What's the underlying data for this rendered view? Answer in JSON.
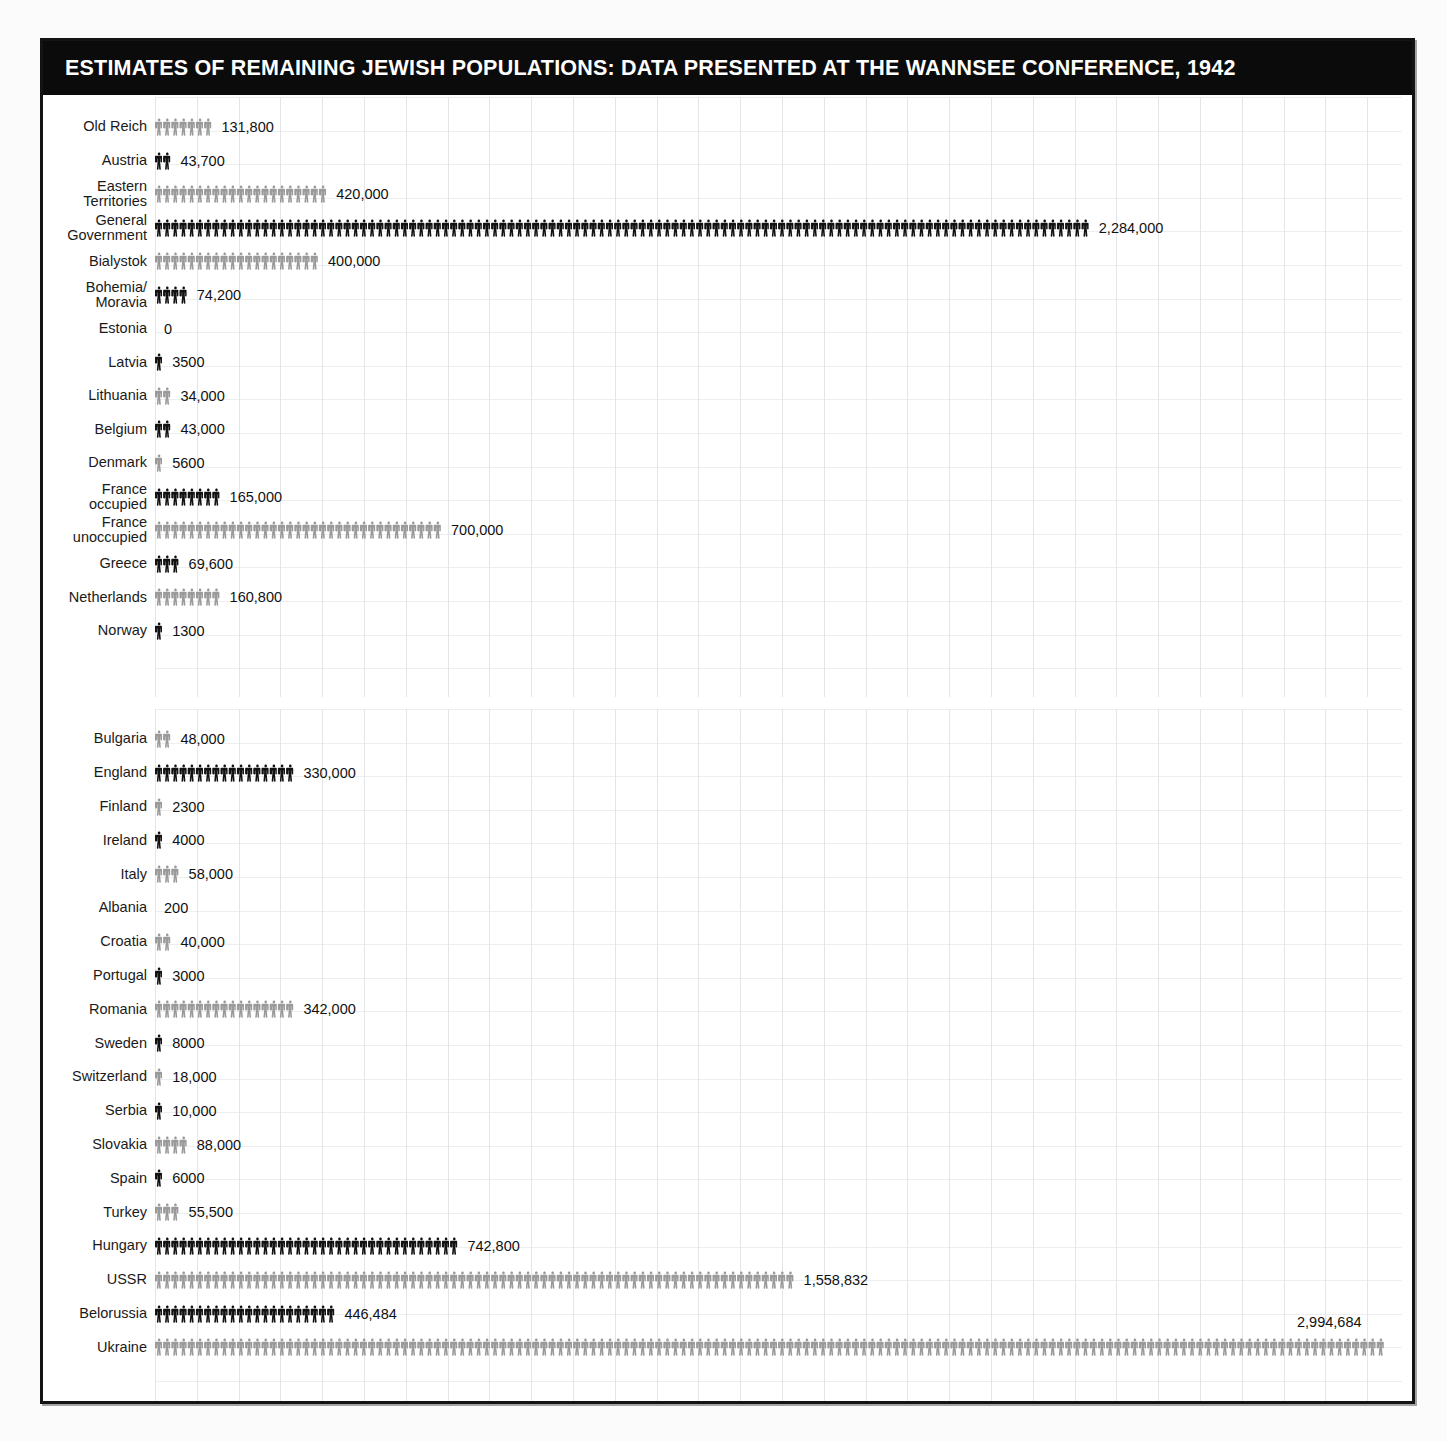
{
  "title": "ESTIMATES OF REMAINING JEWISH POPULATIONS: DATA PRESENTED AT THE WANNSEE CONFERENCE, 1942",
  "colors": {
    "dark_figure": "#121212",
    "light_figure": "#9a9a9a",
    "title_bar": "#0b0b0b",
    "title_text": "#ffffff",
    "grid_line": "#e3e6e8",
    "frame": "#131313",
    "label_text": "#1a1a1a",
    "value_text": "#111111"
  },
  "chart_data": {
    "type": "bar",
    "title": "ESTIMATES OF REMAINING JEWISH POPULATIONS: DATA PRESENTED AT THE WANNSEE CONFERENCE, 1942",
    "xlabel": "",
    "ylabel": "",
    "units_per_icon": 20000,
    "px_per_person": 0.00041,
    "grid": true,
    "legend": "none",
    "xlim": [
      0,
      3050000
    ],
    "panels": [
      {
        "name": "panel-occupied-and-axis-europe",
        "categories": [
          "Old Reich",
          "Austria",
          "Eastern Territories",
          "General Government",
          "Bialystok",
          "Bohemia/ Moravia",
          "Estonia",
          "Latvia",
          "Lithuania",
          "Belgium",
          "Denmark",
          "France occupied",
          "France unoccupied",
          "Greece",
          "Netherlands",
          "Norway"
        ],
        "values": [
          131800,
          43700,
          420000,
          2284000,
          400000,
          74200,
          0,
          3500,
          34000,
          43000,
          5600,
          165000,
          700000,
          69600,
          160800,
          1300
        ],
        "labels": [
          "131,800",
          "43,700",
          "420,000",
          "2,284,000",
          "400,000",
          "74,200",
          "0",
          "3500",
          "34,000",
          "43,000",
          "5600",
          "165,000",
          "700,000",
          "69,600",
          "160,800",
          "1300"
        ],
        "shades": [
          "light",
          "dark",
          "light",
          "dark",
          "light",
          "dark",
          "light",
          "dark",
          "light",
          "dark",
          "light",
          "dark",
          "light",
          "dark",
          "light",
          "dark"
        ],
        "rows": [
          {
            "label": "Old Reich",
            "label_lines": [
              "Old Reich"
            ],
            "value": 131800,
            "display": "131,800",
            "shade": "light"
          },
          {
            "label": "Austria",
            "label_lines": [
              "Austria"
            ],
            "value": 43700,
            "display": "43,700",
            "shade": "dark"
          },
          {
            "label": "Eastern Territories",
            "label_lines": [
              "Eastern",
              "Territories"
            ],
            "value": 420000,
            "display": "420,000",
            "shade": "light"
          },
          {
            "label": "General Government",
            "label_lines": [
              "General",
              "Government"
            ],
            "value": 2284000,
            "display": "2,284,000",
            "shade": "dark"
          },
          {
            "label": "Bialystok",
            "label_lines": [
              "Bialystok"
            ],
            "value": 400000,
            "display": "400,000",
            "shade": "light"
          },
          {
            "label": "Bohemia/ Moravia",
            "label_lines": [
              "Bohemia/",
              "Moravia"
            ],
            "value": 74200,
            "display": "74,200",
            "shade": "dark"
          },
          {
            "label": "Estonia",
            "label_lines": [
              "Estonia"
            ],
            "value": 0,
            "display": "0",
            "shade": "light"
          },
          {
            "label": "Latvia",
            "label_lines": [
              "Latvia"
            ],
            "value": 3500,
            "display": "3500",
            "shade": "dark"
          },
          {
            "label": "Lithuania",
            "label_lines": [
              "Lithuania"
            ],
            "value": 34000,
            "display": "34,000",
            "shade": "light"
          },
          {
            "label": "Belgium",
            "label_lines": [
              "Belgium"
            ],
            "value": 43000,
            "display": "43,000",
            "shade": "dark"
          },
          {
            "label": "Denmark",
            "label_lines": [
              "Denmark"
            ],
            "value": 5600,
            "display": "5600",
            "shade": "light"
          },
          {
            "label": "France occupied",
            "label_lines": [
              "France",
              "occupied"
            ],
            "value": 165000,
            "display": "165,000",
            "shade": "dark"
          },
          {
            "label": "France unoccupied",
            "label_lines": [
              "France",
              "unoccupied"
            ],
            "value": 700000,
            "display": "700,000",
            "shade": "light"
          },
          {
            "label": "Greece",
            "label_lines": [
              "Greece"
            ],
            "value": 69600,
            "display": "69,600",
            "shade": "dark"
          },
          {
            "label": "Netherlands",
            "label_lines": [
              "Netherlands"
            ],
            "value": 160800,
            "display": "160,800",
            "shade": "light"
          },
          {
            "label": "Norway",
            "label_lines": [
              "Norway"
            ],
            "value": 1300,
            "display": "1300",
            "shade": "dark"
          }
        ]
      },
      {
        "name": "panel-neutral-allied-and-east",
        "categories": [
          "Bulgaria",
          "England",
          "Finland",
          "Ireland",
          "Italy",
          "Albania",
          "Croatia",
          "Portugal",
          "Romania",
          "Sweden",
          "Switzerland",
          "Serbia",
          "Slovakia",
          "Spain",
          "Turkey",
          "Hungary",
          "USSR",
          "Belorussia",
          "Ukraine"
        ],
        "values": [
          48000,
          330000,
          2300,
          4000,
          58000,
          200,
          40000,
          3000,
          342000,
          8000,
          18000,
          10000,
          88000,
          6000,
          55500,
          742800,
          1558832,
          446484,
          2994684
        ],
        "labels": [
          "48,000",
          "330,000",
          "2300",
          "4000",
          "58,000",
          "200",
          "40,000",
          "3000",
          "342,000",
          "8000",
          "18,000",
          "10,000",
          "88,000",
          "6000",
          "55,500",
          "742,800",
          "1,558,832",
          "446,484",
          "2,994,684"
        ],
        "shades": [
          "light",
          "dark",
          "light",
          "dark",
          "light",
          "dark",
          "light",
          "dark",
          "light",
          "dark",
          "light",
          "dark",
          "light",
          "dark",
          "light",
          "dark",
          "light",
          "dark",
          "light"
        ],
        "rows": [
          {
            "label": "Bulgaria",
            "label_lines": [
              "Bulgaria"
            ],
            "value": 48000,
            "display": "48,000",
            "shade": "light"
          },
          {
            "label": "England",
            "label_lines": [
              "England"
            ],
            "value": 330000,
            "display": "330,000",
            "shade": "dark"
          },
          {
            "label": "Finland",
            "label_lines": [
              "Finland"
            ],
            "value": 2300,
            "display": "2300",
            "shade": "light"
          },
          {
            "label": "Ireland",
            "label_lines": [
              "Ireland"
            ],
            "value": 4000,
            "display": "4000",
            "shade": "dark"
          },
          {
            "label": "Italy",
            "label_lines": [
              "Italy"
            ],
            "value": 58000,
            "display": "58,000",
            "shade": "light"
          },
          {
            "label": "Albania",
            "label_lines": [
              "Albania"
            ],
            "value": 200,
            "display": "200",
            "shade": "dark"
          },
          {
            "label": "Croatia",
            "label_lines": [
              "Croatia"
            ],
            "value": 40000,
            "display": "40,000",
            "shade": "light"
          },
          {
            "label": "Portugal",
            "label_lines": [
              "Portugal"
            ],
            "value": 3000,
            "display": "3000",
            "shade": "dark"
          },
          {
            "label": "Romania",
            "label_lines": [
              "Romania"
            ],
            "value": 342000,
            "display": "342,000",
            "shade": "light"
          },
          {
            "label": "Sweden",
            "label_lines": [
              "Sweden"
            ],
            "value": 8000,
            "display": "8000",
            "shade": "dark"
          },
          {
            "label": "Switzerland",
            "label_lines": [
              "Switzerland"
            ],
            "value": 18000,
            "display": "18,000",
            "shade": "light"
          },
          {
            "label": "Serbia",
            "label_lines": [
              "Serbia"
            ],
            "value": 10000,
            "display": "10,000",
            "shade": "dark"
          },
          {
            "label": "Slovakia",
            "label_lines": [
              "Slovakia"
            ],
            "value": 88000,
            "display": "88,000",
            "shade": "light"
          },
          {
            "label": "Spain",
            "label_lines": [
              "Spain"
            ],
            "value": 6000,
            "display": "6000",
            "shade": "dark"
          },
          {
            "label": "Turkey",
            "label_lines": [
              "Turkey"
            ],
            "value": 55500,
            "display": "55,500",
            "shade": "light"
          },
          {
            "label": "Hungary",
            "label_lines": [
              "Hungary"
            ],
            "value": 742800,
            "display": "742,800",
            "shade": "dark"
          },
          {
            "label": "USSR",
            "label_lines": [
              "USSR"
            ],
            "value": 1558832,
            "display": "1,558,832",
            "shade": "light"
          },
          {
            "label": "Belorussia",
            "label_lines": [
              "Belorussia"
            ],
            "value": 446484,
            "display": "446,484",
            "shade": "dark"
          },
          {
            "label": "Ukraine",
            "label_lines": [
              "Ukraine"
            ],
            "value": 2994684,
            "display": "2,994,684",
            "shade": "light",
            "value_above": true
          }
        ]
      }
    ]
  }
}
